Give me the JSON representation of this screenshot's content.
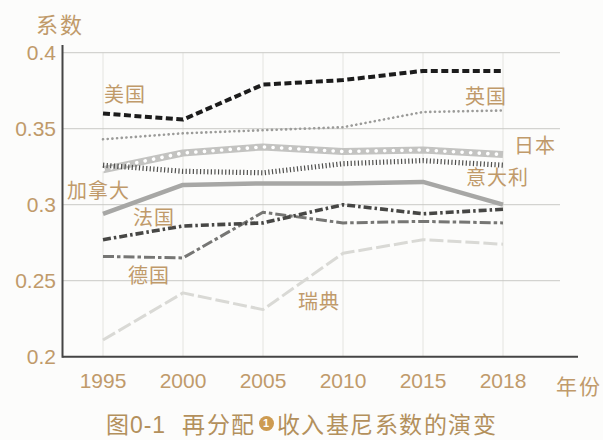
{
  "caption": {
    "figure_label": "图0-1",
    "text_before_footnote": "再分配",
    "footnote_marker": "1",
    "text_after_footnote": "收入基尼系数的演变",
    "color": "#b3905c"
  },
  "chart_data": {
    "type": "line",
    "ylabel": "系数",
    "xlabel": "年份",
    "x_labels": [
      "1995",
      "2000",
      "2005",
      "2010",
      "2015",
      "2018"
    ],
    "ylim": [
      0.2,
      0.4
    ],
    "ytick_values": [
      0.4,
      0.35,
      0.3,
      0.25,
      0.2
    ],
    "ytick_labels": [
      "0.4",
      "0.35",
      "0.3",
      "0.25",
      "0.2"
    ],
    "grid": true,
    "legend_position": "inline-labels",
    "axis_label_color": "#c09a6a",
    "grid_color": "#c9c9c6",
    "axis_color": "#454545",
    "series": [
      {
        "name": "美国",
        "name_en": "usa",
        "values": [
          0.36,
          0.356,
          0.379,
          0.382,
          0.388,
          0.388
        ],
        "color": "#1c1c1c",
        "width": 4,
        "dash": [
          7,
          3.5
        ],
        "z": 8,
        "label_pos": [
          104,
          102
        ]
      },
      {
        "name": "英国",
        "name_en": "uk",
        "values": [
          0.343,
          0.347,
          0.349,
          0.351,
          0.361,
          0.362
        ],
        "color": "#9b9b99",
        "width": 2.6,
        "dash": [
          0.1,
          4.6
        ],
        "linecap": "round",
        "z": 7,
        "label_pos": [
          465,
          104
        ]
      },
      {
        "name": "日本",
        "name_en": "japan",
        "values": [
          0.323,
          0.334,
          0.338,
          0.335,
          0.336,
          0.333
        ],
        "color": "#c3c3c1",
        "width": 7,
        "beads": true,
        "z": 2,
        "label_pos": [
          514,
          153
        ]
      },
      {
        "name": "意大利",
        "name_en": "italy",
        "values": [
          0.326,
          0.322,
          0.321,
          0.327,
          0.329,
          0.326
        ],
        "color": "#4f4f4d",
        "width": 5.2,
        "dash": [
          1.2,
          2.4
        ],
        "z": 3,
        "label_pos": [
          466,
          185
        ]
      },
      {
        "name": "加拿大",
        "name_en": "canada",
        "values": [
          0.294,
          0.313,
          0.314,
          0.314,
          0.315,
          0.3
        ],
        "color": "#a7a7a5",
        "width": 4.5,
        "z": 4,
        "label_pos": [
          67,
          198
        ]
      },
      {
        "name": "法国",
        "name_en": "france",
        "values": [
          0.277,
          0.286,
          0.288,
          0.3,
          0.294,
          0.297
        ],
        "color": "#474745",
        "width": 3.6,
        "dash": [
          8,
          3,
          2.5,
          3
        ],
        "z": 6,
        "label_pos": [
          133,
          225
        ]
      },
      {
        "name": "德国",
        "name_en": "germany",
        "values": [
          0.266,
          0.265,
          0.295,
          0.288,
          0.289,
          0.288
        ],
        "color": "#767674",
        "width": 3,
        "dash": [
          11,
          3,
          3.5,
          3
        ],
        "z": 5,
        "label_pos": [
          128,
          283
        ]
      },
      {
        "name": "瑞典",
        "name_en": "sweden",
        "values": [
          0.211,
          0.242,
          0.231,
          0.268,
          0.277,
          0.274
        ],
        "color": "#d9d9d5",
        "width": 3,
        "dash": [
          14,
          4
        ],
        "z": 1,
        "label_pos": [
          298,
          309
        ]
      }
    ]
  }
}
